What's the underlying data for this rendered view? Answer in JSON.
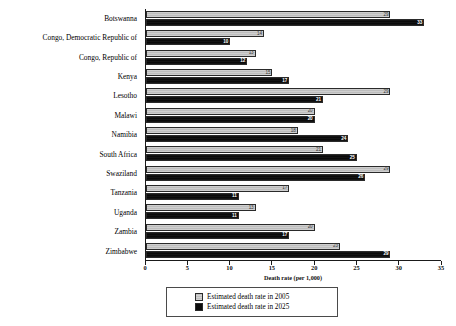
{
  "chart_data": {
    "type": "bar",
    "orientation": "horizontal",
    "title": "",
    "xlabel": "Death rate (per 1,000)",
    "ylabel": "",
    "xlim": [
      0,
      35
    ],
    "xticks": [
      0,
      5,
      10,
      15,
      20,
      25,
      30,
      35
    ],
    "grid": false,
    "legend_position": "bottom",
    "categories": [
      "Botswanna",
      "Congo, Democratic Republic of",
      "Congo, Republic of",
      "Kenya",
      "Lesotho",
      "Malawi",
      "Namibia",
      "South Africa",
      "Swaziland",
      "Tanzania",
      "Uganda",
      "Zambia",
      "Zimbabwe"
    ],
    "series": [
      {
        "name": "Estimated death rate in 2005",
        "color": "#c6c6c6",
        "values": [
          29,
          14,
          13,
          15,
          29,
          20,
          18,
          21,
          29,
          17,
          13,
          20,
          23
        ]
      },
      {
        "name": "Estimated death rate in 2025",
        "color": "#0d0d0d",
        "values": [
          33,
          10,
          12,
          17,
          21,
          20,
          24,
          25,
          26,
          11,
          11,
          17,
          29
        ]
      }
    ]
  },
  "axis": {
    "x_title": "Death rate (per 1,000)",
    "tick_labels": [
      "0",
      "5",
      "10",
      "15",
      "20",
      "25",
      "30",
      "35"
    ]
  },
  "legend": {
    "items": [
      {
        "label": "Estimated death rate in 2005",
        "swatch": "light-gray-pattern"
      },
      {
        "label": "Estimated death rate in 2025",
        "swatch": "black-solid"
      }
    ]
  }
}
